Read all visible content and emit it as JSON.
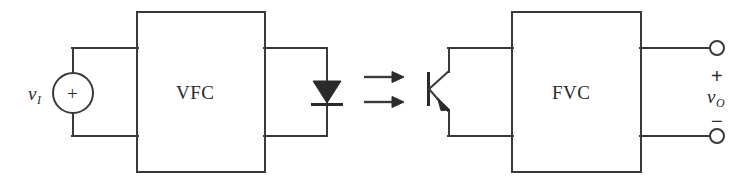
{
  "figure": {
    "background_color": "#ffffff",
    "line_color": "#3a3a3a",
    "fill_color": "#2a2a2a"
  },
  "blocks": [
    {
      "id": "vfc",
      "label": "VFC",
      "name": "voltage-to-frequency-converter"
    },
    {
      "id": "fvc",
      "label": "FVC",
      "name": "frequency-to-voltage-converter"
    }
  ],
  "sources": [
    {
      "id": "input-source",
      "symbol": "v",
      "subscript": "I",
      "polarity": "+",
      "name": "input-voltage-source"
    }
  ],
  "components": [
    {
      "id": "led",
      "type": "diode",
      "name": "light-emitting-diode"
    },
    {
      "id": "phototransistor",
      "type": "npn-transistor",
      "name": "phototransistor"
    }
  ],
  "coupling": {
    "name": "optical-coupling-arrows",
    "arrow_count": 2,
    "glyph": "→"
  },
  "output": {
    "symbol": "v",
    "subscript": "O",
    "plus_label": "+",
    "minus_label": "−",
    "terminal_count": 2,
    "name": "output-terminals"
  }
}
